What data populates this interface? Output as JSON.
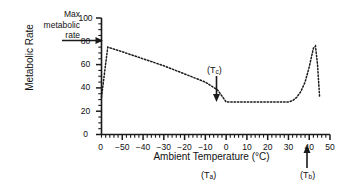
{
  "chart_data": {
    "type": "line",
    "title": "",
    "xlabel": "Ambient Temperature (°C)",
    "ylabel": "Metabolic Rate",
    "xlim": [
      -60,
      50
    ],
    "ylim": [
      0,
      100
    ],
    "grid": false,
    "legend": "none",
    "line_style": "dotted",
    "x_major_ticks": [
      -50,
      -40,
      -30,
      -20,
      -10,
      0,
      10,
      20,
      30,
      40,
      50
    ],
    "x_major_tick_labels": [
      "−50",
      "−40",
      "−30",
      "−20",
      "−10",
      "0",
      "10",
      "20",
      "30",
      "40",
      "50"
    ],
    "x_minor_tick_interval": 2,
    "y_major_ticks": [
      0,
      20,
      40,
      60,
      80,
      100
    ],
    "y_major_tick_labels": [
      "0",
      "20",
      "40",
      "60",
      "80",
      "100"
    ],
    "y_minor_tick_interval": 5,
    "origin_label": "0",
    "series": [
      {
        "name": "Metabolic rate vs ambient temperature",
        "x": [
          -60,
          -57,
          -50,
          -40,
          -30,
          -20,
          -10,
          -4,
          0,
          5,
          10,
          15,
          20,
          25,
          30,
          32,
          34,
          36,
          38,
          40,
          42,
          43,
          44,
          45
        ],
        "values": [
          32,
          75,
          71,
          65,
          59,
          52,
          45,
          38,
          28,
          28,
          28,
          28,
          28,
          28,
          28,
          29,
          32,
          37,
          45,
          58,
          74,
          76,
          60,
          32
        ]
      }
    ],
    "annotations": [
      {
        "name": "max-metabolic-rate",
        "text": "Max metabolic rate",
        "lines": [
          "Max",
          "metabolic",
          "rate"
        ],
        "arrow": "right",
        "points_to_x": -57,
        "points_to_y": 75
      },
      {
        "name": "lower-critical-temperature",
        "text": "(Tc)",
        "base": "(T",
        "sub": "c",
        "close": ")",
        "arrow": "down",
        "points_to_x": 0,
        "points_to_y": 28
      },
      {
        "name": "body-temperature",
        "text": "(Tb)",
        "base": "(T",
        "sub": "b",
        "close": ")",
        "arrow": "up",
        "points_to_x": 37
      },
      {
        "name": "ambient-temperature-symbol",
        "text": "(Ta)",
        "base": "(T",
        "sub": "a",
        "close": ")"
      }
    ],
    "colors": {
      "curve": "#1a1a1a",
      "axis": "#1a1a1a",
      "background": "#ffffff",
      "text": "#111111"
    }
  }
}
